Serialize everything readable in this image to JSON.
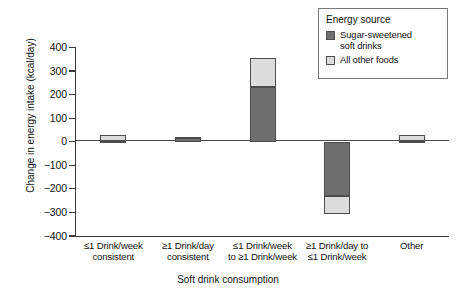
{
  "chart_data": {
    "type": "bar",
    "stacked": true,
    "title": "",
    "xlabel": "Soft drink consumption",
    "ylabel": "Change in energy intake (kcal/day)",
    "ylim": [
      -400,
      400
    ],
    "ytick_values": [
      400,
      300,
      200,
      100,
      0,
      -100,
      -200,
      -300,
      -400
    ],
    "ytick_labels": [
      "400",
      "300",
      "200",
      "100",
      "0",
      "−100",
      "−200",
      "−300",
      "−400"
    ],
    "grid": false,
    "legend_title": "Energy source",
    "legend_position": "top-right",
    "categories": [
      "≤1 Drink/week consistent",
      "≥1 Drink/day consistent",
      "≤1 Drink/week to ≥1 Drink/week",
      "≥1 Drink/day to ≤1 Drink/week",
      "Other"
    ],
    "category_lines": [
      [
        "≤1 Drink/week",
        "consistent"
      ],
      [
        "≥1 Drink/day",
        "consistent"
      ],
      [
        "≤1 Drink/week",
        "to ≥1 Drink/week"
      ],
      [
        "≥1 Drink/day to",
        "≤1 Drink/week"
      ],
      [
        "Other",
        ""
      ]
    ],
    "series": [
      {
        "name": "Sugar-sweetened soft drinks",
        "color": "#6e6e6e",
        "values": [
          3,
          15,
          234,
          -230,
          2
        ]
      },
      {
        "name": "All other foods",
        "color": "#dcdcdc",
        "values": [
          25,
          5,
          123,
          -76,
          26
        ]
      }
    ],
    "totals": [
      28,
      20,
      357,
      -306,
      28
    ]
  },
  "legend": {
    "title": "Energy source",
    "entries": [
      {
        "label_line1": "Sugar-sweetened",
        "label_line2": "soft drinks",
        "color": "#6e6e6e"
      },
      {
        "label_line1": "All other foods",
        "label_line2": "",
        "color": "#dcdcdc"
      }
    ]
  },
  "axes": {
    "x_title": "Soft drink consumption",
    "y_title": "Change in energy intake (kcal/day)"
  }
}
